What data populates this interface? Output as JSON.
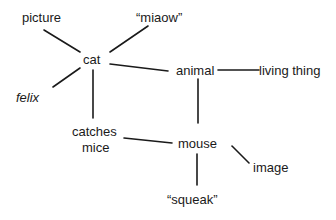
{
  "diagram": {
    "type": "semantic-network",
    "nodes": [
      {
        "id": "picture",
        "label": "picture"
      },
      {
        "id": "miaow",
        "label": "“miaow”"
      },
      {
        "id": "cat",
        "label": "cat"
      },
      {
        "id": "animal",
        "label": "animal"
      },
      {
        "id": "living_thing",
        "label": "living thing"
      },
      {
        "id": "felix",
        "label": "felix"
      },
      {
        "id": "catches_mice_1",
        "label": "catches"
      },
      {
        "id": "catches_mice_2",
        "label": "mice"
      },
      {
        "id": "mouse",
        "label": "mouse"
      },
      {
        "id": "image",
        "label": "image"
      },
      {
        "id": "squeak",
        "label": "“squeak”"
      }
    ],
    "edges": [
      [
        "picture",
        "cat"
      ],
      [
        "miaow",
        "cat"
      ],
      [
        "felix",
        "cat"
      ],
      [
        "cat",
        "animal"
      ],
      [
        "cat",
        "catches mice"
      ],
      [
        "animal",
        "living thing"
      ],
      [
        "animal",
        "mouse"
      ],
      [
        "catches mice",
        "mouse"
      ],
      [
        "mouse",
        "image"
      ],
      [
        "mouse",
        "squeak"
      ]
    ]
  }
}
